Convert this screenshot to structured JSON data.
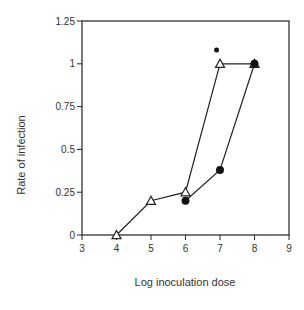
{
  "chart_data": {
    "type": "line",
    "title": "",
    "xlabel": "Log inoculation dose",
    "ylabel": "Rate of infection",
    "xlim": [
      3,
      9
    ],
    "ylim": [
      0,
      1.25
    ],
    "x_ticks": [
      "3",
      "4",
      "5",
      "6",
      "7",
      "8",
      "9"
    ],
    "y_ticks": [
      "0",
      "0.25",
      "0.5",
      "0.75",
      "1",
      "1.25"
    ],
    "grid": false,
    "legend": null,
    "series": [
      {
        "name": "open triangles",
        "marker": "triangle-open",
        "x": [
          4,
          5,
          6,
          7,
          8
        ],
        "y": [
          0,
          0.2,
          0.25,
          1.0,
          1.0
        ]
      },
      {
        "name": "filled circles",
        "marker": "circle-filled",
        "x": [
          6,
          7,
          8
        ],
        "y": [
          0.2,
          0.38,
          1.0
        ]
      }
    ],
    "annotations": [
      {
        "marker": "small-filled-dot",
        "x": 6.9,
        "y": 1.08
      }
    ]
  }
}
